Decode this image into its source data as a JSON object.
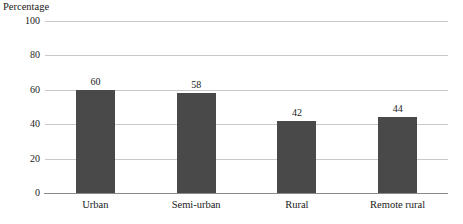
{
  "chart_data": {
    "type": "bar",
    "title": "",
    "ylabel": "Percentage",
    "xlabel": "",
    "categories": [
      "Urban",
      "Semi-urban",
      "Rural",
      "Remote rural"
    ],
    "values": [
      60,
      58,
      42,
      44
    ],
    "value_labels": [
      "60",
      "58",
      "42",
      "44"
    ],
    "ylim": [
      0,
      100
    ],
    "yticks": [
      0,
      20,
      40,
      60,
      80,
      100
    ],
    "ytick_labels": [
      "0",
      "20",
      "40",
      "60",
      "80",
      "100"
    ],
    "grid": true,
    "legend": "none",
    "bar_color": "#494949",
    "gridline_color": "#c8c8c8",
    "axis_color": "#8a8a8a",
    "text_color": "#1a1a1a"
  }
}
